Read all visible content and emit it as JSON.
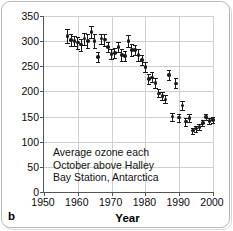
{
  "figure": {
    "panel_label": "b",
    "annotation_lines": [
      "Average ozone each",
      "October above Halley",
      "Bay Station, Antarctica"
    ]
  },
  "chart_data": {
    "type": "scatter",
    "title": "",
    "xlabel": "Year",
    "ylabel": "Ozone (DU)",
    "xlim": [
      1950,
      2000
    ],
    "ylim": [
      0,
      350
    ],
    "xticks": [
      1950,
      1960,
      1970,
      1980,
      1990,
      2000
    ],
    "yticks": [
      0,
      50,
      100,
      150,
      200,
      250,
      300,
      350
    ],
    "grid": true,
    "legend": null,
    "units": "DU (Dobson Units)",
    "error_bars": "vertical, symmetric, ~10-15 DU",
    "series": [
      {
        "name": "October mean total column ozone, Halley Bay",
        "marker": "filled-circle",
        "color": "#1b1b1b",
        "points": [
          {
            "year": 1957,
            "value": 310,
            "err": 14
          },
          {
            "year": 1958,
            "value": 302,
            "err": 12
          },
          {
            "year": 1959,
            "value": 300,
            "err": 10
          },
          {
            "year": 1960,
            "value": 297,
            "err": 12
          },
          {
            "year": 1961,
            "value": 293,
            "err": 12
          },
          {
            "year": 1962,
            "value": 305,
            "err": 12
          },
          {
            "year": 1963,
            "value": 300,
            "err": 14
          },
          {
            "year": 1964,
            "value": 318,
            "err": 12
          },
          {
            "year": 1965,
            "value": 300,
            "err": 14
          },
          {
            "year": 1966,
            "value": 268,
            "err": 10
          },
          {
            "year": 1967,
            "value": 305,
            "err": 10
          },
          {
            "year": 1968,
            "value": 303,
            "err": 12
          },
          {
            "year": 1969,
            "value": 288,
            "err": 10
          },
          {
            "year": 1970,
            "value": 275,
            "err": 10
          },
          {
            "year": 1971,
            "value": 276,
            "err": 10
          },
          {
            "year": 1972,
            "value": 288,
            "err": 10
          },
          {
            "year": 1973,
            "value": 272,
            "err": 12
          },
          {
            "year": 1974,
            "value": 270,
            "err": 10
          },
          {
            "year": 1975,
            "value": 300,
            "err": 12
          },
          {
            "year": 1976,
            "value": 282,
            "err": 12
          },
          {
            "year": 1977,
            "value": 282,
            "err": 10
          },
          {
            "year": 1978,
            "value": 272,
            "err": 12
          },
          {
            "year": 1979,
            "value": 263,
            "err": 10
          },
          {
            "year": 1980,
            "value": 248,
            "err": 10
          },
          {
            "year": 1981,
            "value": 225,
            "err": 10
          },
          {
            "year": 1982,
            "value": 228,
            "err": 10
          },
          {
            "year": 1983,
            "value": 217,
            "err": 10
          },
          {
            "year": 1984,
            "value": 196,
            "err": 8
          },
          {
            "year": 1985,
            "value": 191,
            "err": 8
          },
          {
            "year": 1986,
            "value": 184,
            "err": 8
          },
          {
            "year": 1987,
            "value": 233,
            "err": 10
          },
          {
            "year": 1988,
            "value": 150,
            "err": 8
          },
          {
            "year": 1989,
            "value": 216,
            "err": 10
          },
          {
            "year": 1990,
            "value": 148,
            "err": 8
          },
          {
            "year": 1991,
            "value": 172,
            "err": 8
          },
          {
            "year": 1992,
            "value": 140,
            "err": 8
          },
          {
            "year": 1993,
            "value": 147,
            "err": 8
          },
          {
            "year": 1994,
            "value": 122,
            "err": 6
          },
          {
            "year": 1995,
            "value": 126,
            "err": 6
          },
          {
            "year": 1996,
            "value": 129,
            "err": 6
          },
          {
            "year": 1997,
            "value": 137,
            "err": 6
          },
          {
            "year": 1998,
            "value": 149,
            "err": 6
          },
          {
            "year": 1999,
            "value": 141,
            "err": 6
          },
          {
            "year": 2000,
            "value": 143,
            "err": 6
          }
        ]
      }
    ]
  }
}
